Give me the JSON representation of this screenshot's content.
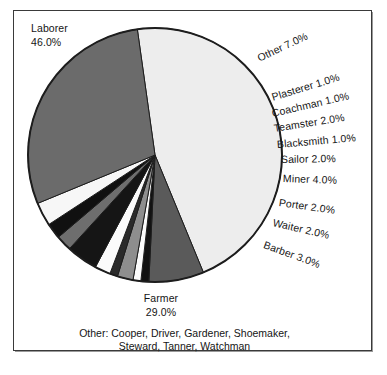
{
  "chart_data": {
    "type": "pie",
    "title": "",
    "subtitle": "",
    "xlabel": "",
    "ylabel": "",
    "units": "percent",
    "start_angle_deg": -8,
    "direction": "clockwise",
    "legend": "none (direct labels)",
    "grid": false,
    "total": 100.0,
    "categories": [
      "Laborer",
      "Other",
      "Plasterer",
      "Coachman",
      "Teamster",
      "Blacksmith",
      "Sailor",
      "Miner",
      "Porter",
      "Waiter",
      "Barber",
      "Farmer"
    ],
    "values": [
      46.0,
      7.0,
      1.0,
      1.0,
      2.0,
      1.0,
      2.0,
      4.0,
      2.0,
      2.0,
      3.0,
      29.0
    ],
    "slices": [
      {
        "label": "Laborer",
        "value": 46.0,
        "value_text": "46.0%",
        "fill": "#ededed"
      },
      {
        "label": "Other",
        "value": 7.0,
        "value_text": "7.0%",
        "fill": "#5a5a5a"
      },
      {
        "label": "Plasterer",
        "value": 1.0,
        "value_text": "1.0%",
        "fill": "#121212"
      },
      {
        "label": "Coachman",
        "value": 1.0,
        "value_text": "1.0%",
        "fill": "#fbfbfb"
      },
      {
        "label": "Teamster",
        "value": 2.0,
        "value_text": "2.0%",
        "fill": "#8e8e8e"
      },
      {
        "label": "Blacksmith",
        "value": 1.0,
        "value_text": "1.0%",
        "fill": "#2a2a2a"
      },
      {
        "label": "Sailor",
        "value": 2.0,
        "value_text": "2.0%",
        "fill": "#fbfbfb"
      },
      {
        "label": "Miner",
        "value": 4.0,
        "value_text": "4.0%",
        "fill": "#151515"
      },
      {
        "label": "Porter",
        "value": 2.0,
        "value_text": "2.0%",
        "fill": "#6e6e6e"
      },
      {
        "label": "Waiter",
        "value": 2.0,
        "value_text": "2.0%",
        "fill": "#101010"
      },
      {
        "label": "Barber",
        "value": 3.0,
        "value_text": "3.0%",
        "fill": "#f7f7f7"
      },
      {
        "label": "Farmer",
        "value": 29.0,
        "value_text": "29.0%",
        "fill": "#6b6b6b"
      }
    ],
    "annotation": "Other: Cooper, Driver, Gardener, Shoemaker, Steward, Tanner, Watchman",
    "annotation_lines": [
      "Other: Cooper, Driver, Gardener, Shoemaker,",
      "Steward, Tanner, Watchman"
    ],
    "other_members": [
      "Cooper",
      "Driver",
      "Gardener",
      "Shoemaker",
      "Steward",
      "Tanner",
      "Watchman"
    ]
  },
  "labels": {
    "laborer": {
      "name": "Laborer",
      "pct": "46.0%"
    },
    "farmer": {
      "name": "Farmer",
      "pct": "29.0%"
    },
    "other": {
      "text": "Other 7.0%"
    },
    "plasterer": {
      "text": "Plasterer 1.0%"
    },
    "coachman": {
      "text": "Coachman 1.0%"
    },
    "teamster": {
      "text": "Teamster 2.0%"
    },
    "blacksmith": {
      "text": "Blacksmith 1.0%"
    },
    "sailor": {
      "text": "Sailor 2.0%"
    },
    "miner": {
      "text": "Miner 4.0%"
    },
    "porter": {
      "text": "Porter 2.0%"
    },
    "waiter": {
      "text": "Waiter 2.0%"
    },
    "barber": {
      "text": "Barber 3.0%"
    }
  },
  "footnote": {
    "line1": "Other: Cooper, Driver, Gardener, Shoemaker,",
    "line2": "Steward, Tanner, Watchman"
  },
  "style": {
    "outline_color": "#1d1d1d",
    "frame_color": "#3a3a3a",
    "background": "#ffffff"
  }
}
